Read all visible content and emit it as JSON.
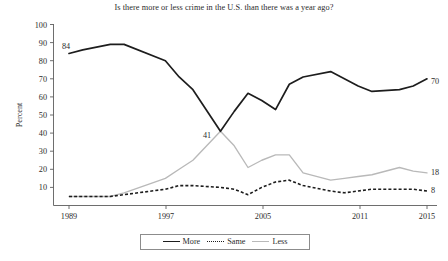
{
  "chart_data": {
    "type": "line",
    "title": "Is there more or less crime in the U.S. than there was a year ago?",
    "xlabel": "",
    "ylabel": "Percent",
    "ylim": [
      0,
      100
    ],
    "xlim": [
      1989,
      2015
    ],
    "grid": false,
    "legend_position": "bottom",
    "ytick_labels": [
      "10",
      "20",
      "30",
      "40",
      "50",
      "60",
      "70",
      "80",
      "90",
      "100"
    ],
    "ytick_values": [
      10,
      20,
      30,
      40,
      50,
      60,
      70,
      80,
      90,
      100
    ],
    "xtick_labels": [
      "1989",
      "1997",
      "2005",
      "2011",
      "2015"
    ],
    "xtick_values": [
      1989,
      1997,
      2005,
      2011,
      2015
    ],
    "x": [
      1989,
      1990,
      1992,
      1993,
      1996,
      1997,
      1998,
      2000,
      2001,
      2002,
      2003,
      2004,
      2005,
      2006,
      2008,
      2009,
      2010,
      2011,
      2013,
      2014,
      2015
    ],
    "series": [
      {
        "name": "More",
        "style": "solid",
        "color": "#1d1d1d",
        "values": [
          84,
          86,
          89,
          89,
          80,
          71,
          64,
          41,
          52,
          62,
          58,
          53,
          67,
          71,
          74,
          70,
          66,
          63,
          64,
          66,
          70
        ],
        "end_label": "70",
        "start_label": "84",
        "annotation_label": "41"
      },
      {
        "name": "Same",
        "style": "dotted",
        "color": "#1d1d1d",
        "values": [
          5,
          5,
          5,
          6,
          9,
          11,
          11,
          10,
          9,
          6,
          10,
          13,
          14,
          11,
          8,
          7,
          8,
          9,
          9,
          9,
          8
        ],
        "end_label": "8"
      },
      {
        "name": "Less",
        "style": "solid",
        "color": "#b9b9b9",
        "values": [
          5,
          5,
          5,
          7,
          15,
          20,
          25,
          41,
          33,
          21,
          25,
          28,
          28,
          18,
          14,
          15,
          16,
          17,
          21,
          19,
          18
        ],
        "end_label": "18"
      }
    ],
    "annotations": [
      {
        "text": "84",
        "series": "More",
        "x": 1989,
        "y": 84
      },
      {
        "text": "41",
        "series": "More",
        "x": 2000,
        "y": 41
      },
      {
        "text": "70",
        "series": "More",
        "x": 2015,
        "y": 70
      },
      {
        "text": "18",
        "series": "Less",
        "x": 2015,
        "y": 18
      },
      {
        "text": "8",
        "series": "Same",
        "x": 2015,
        "y": 8
      }
    ]
  },
  "legend": {
    "items": [
      {
        "label": "More"
      },
      {
        "label": "Same"
      },
      {
        "label": "Less"
      }
    ]
  }
}
